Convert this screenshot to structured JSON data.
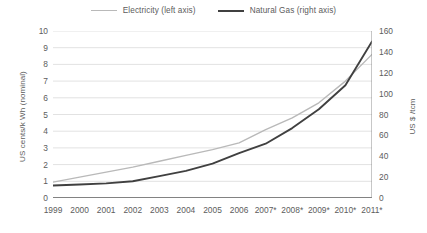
{
  "legend": {
    "position": "top-center",
    "items": [
      {
        "name": "electricity",
        "label": "Electricity (left axis)",
        "color": "#b9b9b9"
      },
      {
        "name": "natural-gas",
        "label": "Natural Gas (right axis)",
        "color": "#404040"
      }
    ]
  },
  "axes": {
    "y_left_title": "US cents/k Wh (nominal)",
    "y_right_title": "US $ /tcm"
  },
  "chart_data": {
    "type": "line",
    "title": "",
    "subtitle": "",
    "xlabel": "",
    "ylabel": "US cents/k Wh (nominal)",
    "y2label": "US $ /tcm",
    "grid": true,
    "legend_position": "top-center",
    "categories": [
      "1999",
      "2000",
      "2001",
      "2002",
      "2003",
      "2004",
      "2005",
      "2006",
      "2007*",
      "2008*",
      "2009*",
      "2010*",
      "2011*"
    ],
    "x": [
      "1999",
      "2000",
      "2001",
      "2002",
      "2003",
      "2004",
      "2005",
      "2006",
      "2007*",
      "2008*",
      "2009*",
      "2010*",
      "2011*"
    ],
    "ylim": [
      0,
      10
    ],
    "yticks": [
      0,
      1,
      2,
      3,
      4,
      5,
      6,
      7,
      8,
      9,
      10
    ],
    "y2lim": [
      0,
      160
    ],
    "y2ticks": [
      0,
      20,
      40,
      60,
      80,
      100,
      120,
      140,
      160
    ],
    "series": [
      {
        "name": "Electricity (left axis)",
        "axis": "left",
        "units": "US cents/k Wh (nominal)",
        "color": "#b9b9b9",
        "values": [
          0.95,
          1.25,
          1.55,
          1.85,
          2.2,
          2.55,
          2.9,
          3.3,
          4.1,
          4.8,
          5.7,
          7.0,
          8.6
        ]
      },
      {
        "name": "Natural Gas (right axis)",
        "axis": "right",
        "units": "US $ /tcm",
        "color": "#404040",
        "values": [
          12,
          13,
          14,
          16,
          21,
          26,
          33,
          43,
          52,
          67,
          85,
          108,
          150
        ]
      }
    ]
  }
}
